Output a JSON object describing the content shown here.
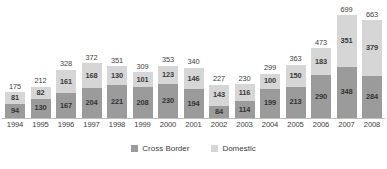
{
  "chart_data": {
    "type": "bar",
    "stacked": true,
    "title": "",
    "subtitle": "",
    "xlabel": "",
    "ylabel": "",
    "grid": false,
    "legend_position": "bottom-center",
    "ylim": [
      0,
      699
    ],
    "categories": [
      "1994",
      "1995",
      "1996",
      "1997",
      "1998",
      "1999",
      "2000",
      "2001",
      "2002",
      "2003",
      "2004",
      "2005",
      "2006",
      "2007",
      "2008"
    ],
    "series": [
      {
        "name": "Cross Border",
        "color": "#9b9b9b",
        "values": [
          94,
          130,
          167,
          204,
          221,
          208,
          230,
          194,
          84,
          114,
          199,
          213,
          290,
          348,
          284
        ]
      },
      {
        "name": "Domestic",
        "color": "#d6d6d6",
        "values": [
          81,
          82,
          161,
          168,
          130,
          101,
          123,
          146,
          143,
          116,
          100,
          150,
          183,
          351,
          379
        ]
      }
    ],
    "totals": [
      175,
      212,
      328,
      372,
      351,
      309,
      353,
      340,
      227,
      230,
      299,
      363,
      473,
      699,
      663
    ]
  },
  "legend": {
    "items": [
      {
        "label": "Cross Border",
        "color": "#9b9b9b"
      },
      {
        "label": "Domestic",
        "color": "#d6d6d6"
      }
    ]
  }
}
